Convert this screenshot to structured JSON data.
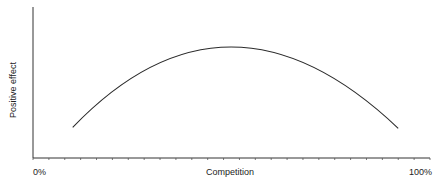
{
  "chart_data": {
    "type": "line",
    "title": "",
    "xlabel": "Competition",
    "ylabel": "Positive effect",
    "x_tick_labels": [
      "0%",
      "100%"
    ],
    "xlim": [
      0,
      100
    ],
    "grid": false,
    "legend": null,
    "series": [
      {
        "name": "Positive effect",
        "shape": "inverted-U (parabolic)",
        "x": [
          10,
          20,
          30,
          40,
          50,
          60,
          70,
          80,
          90,
          92
        ],
        "y": [
          0.18,
          0.52,
          0.77,
          0.93,
          1.0,
          0.97,
          0.86,
          0.66,
          0.36,
          0.17
        ]
      }
    ],
    "annotations": [],
    "peak": {
      "x": 50,
      "y": 1.0
    }
  },
  "labels": {
    "x_min": "0%",
    "x_max": "100%",
    "x_title": "Competition",
    "y_title": "Positive effect"
  }
}
